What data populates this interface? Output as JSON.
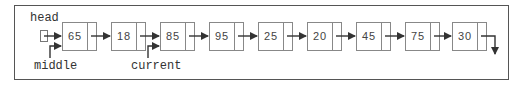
{
  "diagram": {
    "type": "singly-linked-list",
    "labels": {
      "head": "head",
      "middle": "middle",
      "current": "current"
    },
    "nodes": [
      {
        "value": "65"
      },
      {
        "value": "18"
      },
      {
        "value": "85"
      },
      {
        "value": "95"
      },
      {
        "value": "25"
      },
      {
        "value": "20"
      },
      {
        "value": "45"
      },
      {
        "value": "75"
      },
      {
        "value": "30"
      }
    ],
    "pointers": {
      "head": {
        "points_to_index": 0
      },
      "middle": {
        "points_to_index": 0
      },
      "current": {
        "points_to_index": 2
      }
    },
    "terminal": "null-arrow-down",
    "colors": {
      "line": "#333333",
      "box_border": "#888888",
      "frame": "#555555"
    }
  }
}
